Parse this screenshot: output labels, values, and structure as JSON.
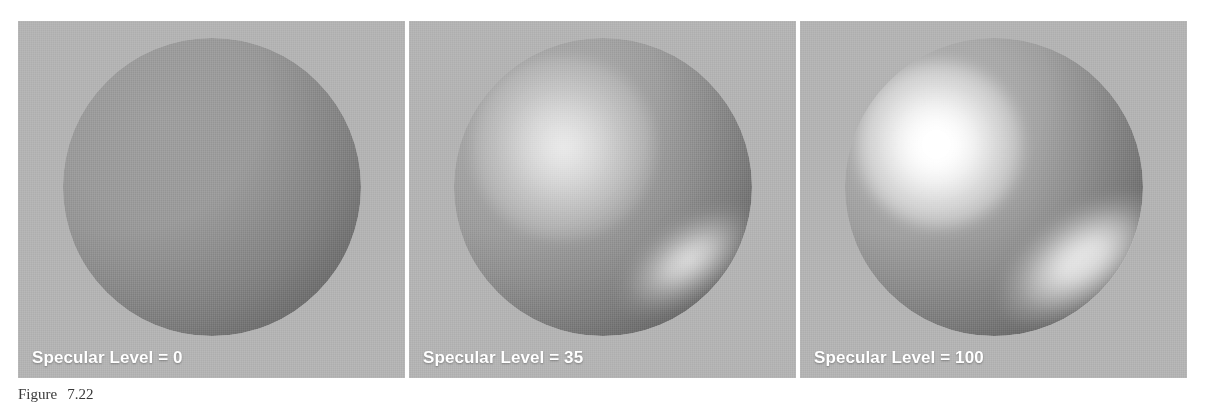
{
  "figure": {
    "caption_label": "Figure",
    "caption_number": "7.22",
    "caption_text": ""
  },
  "panels": [
    {
      "id": "sphere-0",
      "label": "Specular Level = 0",
      "specular_level": 0,
      "description": "Matte gray sphere with diffuse shading only, no specular highlight"
    },
    {
      "id": "sphere-35",
      "label": "Specular Level = 35",
      "specular_level": 35,
      "description": "Gray sphere with a soft broad specular highlight upper-left and a secondary elongated highlight lower-right"
    },
    {
      "id": "sphere-100",
      "label": "Specular Level = 100",
      "specular_level": 100,
      "description": "Gray sphere with an intense white specular highlight upper-left and a bright elongated highlight lower-right"
    }
  ],
  "colors": {
    "panel_background": "#b3b3b3",
    "label_text": "#ffffff",
    "page_background": "#ffffff",
    "caption_text": "#3a3a3a",
    "sphere_midtone": "#959595",
    "highlight": "#ffffff"
  }
}
